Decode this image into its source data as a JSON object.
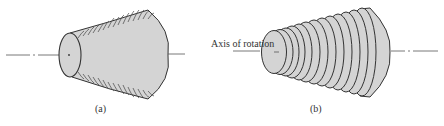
{
  "figure": {
    "panels": [
      {
        "id": "a",
        "caption": "(a)",
        "description": "Frustum solid of revolution with curved striations (thin shells)"
      },
      {
        "id": "b",
        "caption": "(b)",
        "description": "Frustum approximated by a stack of thin disks"
      }
    ],
    "annotation": "Axis of rotation",
    "colors": {
      "fill": "#d4d4d4",
      "stroke": "#333333",
      "axis": "#555555"
    }
  }
}
